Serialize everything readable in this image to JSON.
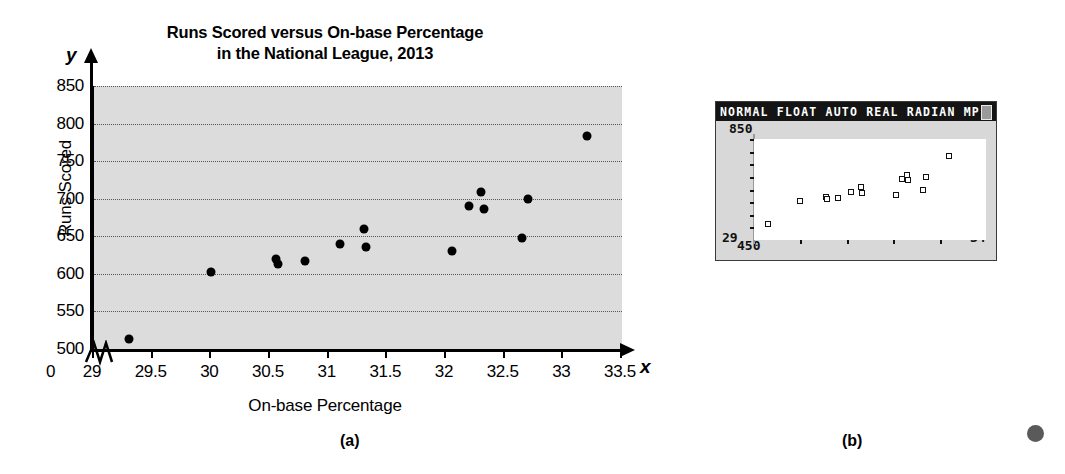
{
  "figure": {
    "panel_a_caption": "(a)",
    "panel_b_caption": "(b)"
  },
  "chart_data": {
    "type": "scatter",
    "title": "Runs Scored versus On-base Percentage in the National League, 2013",
    "title_line1": "Runs Scored versus On-base Percentage",
    "title_line2": "in the National League, 2013",
    "xlabel": "On-base Percentage",
    "ylabel": "Runs Scored",
    "x_axis_variable": "x",
    "y_axis_variable": "y",
    "origin_label": "0",
    "xlim": [
      29,
      33.5
    ],
    "ylim": [
      500,
      850
    ],
    "xticks": [
      "29",
      "29.5",
      "30",
      "30.5",
      "31",
      "31.5",
      "32",
      "32.5",
      "33",
      "33.5"
    ],
    "xtick_values": [
      29,
      29.5,
      30,
      30.5,
      31,
      31.5,
      32,
      32.5,
      33,
      33.5
    ],
    "yticks": [
      "500",
      "550",
      "600",
      "650",
      "700",
      "750",
      "800",
      "850"
    ],
    "ytick_values": [
      500,
      550,
      600,
      650,
      700,
      750,
      800,
      850
    ],
    "grid": true,
    "axis_break": true,
    "legend": "none",
    "marker": "filled-circle",
    "points": [
      {
        "x": 29.3,
        "y": 513
      },
      {
        "x": 30.0,
        "y": 603
      },
      {
        "x": 30.55,
        "y": 620
      },
      {
        "x": 30.57,
        "y": 613
      },
      {
        "x": 30.8,
        "y": 617
      },
      {
        "x": 31.1,
        "y": 640
      },
      {
        "x": 31.3,
        "y": 660
      },
      {
        "x": 31.32,
        "y": 636
      },
      {
        "x": 32.05,
        "y": 630
      },
      {
        "x": 32.2,
        "y": 690
      },
      {
        "x": 32.3,
        "y": 709
      },
      {
        "x": 32.32,
        "y": 686
      },
      {
        "x": 32.65,
        "y": 648
      },
      {
        "x": 32.7,
        "y": 700
      },
      {
        "x": 33.2,
        "y": 783
      }
    ]
  },
  "calculator": {
    "statusbar": "NORMAL FLOAT AUTO REAL RADIAN MP",
    "battery_icon": "battery-icon",
    "window": {
      "xmin_label": "29",
      "xmax_label": "34",
      "ymin_label": "450",
      "ymax_label": "850",
      "xmin": 29,
      "xmax": 34,
      "ymin": 450,
      "ymax": 850
    },
    "plot": {
      "type": "scatter",
      "marker": "open-square",
      "points": [
        {
          "x": 29.3,
          "y": 513
        },
        {
          "x": 30.0,
          "y": 603
        },
        {
          "x": 30.55,
          "y": 620
        },
        {
          "x": 30.57,
          "y": 613
        },
        {
          "x": 30.8,
          "y": 617
        },
        {
          "x": 31.1,
          "y": 640
        },
        {
          "x": 31.3,
          "y": 660
        },
        {
          "x": 31.32,
          "y": 636
        },
        {
          "x": 32.05,
          "y": 630
        },
        {
          "x": 32.2,
          "y": 690
        },
        {
          "x": 32.3,
          "y": 709
        },
        {
          "x": 32.32,
          "y": 686
        },
        {
          "x": 32.65,
          "y": 648
        },
        {
          "x": 32.7,
          "y": 700
        },
        {
          "x": 33.2,
          "y": 783
        }
      ]
    }
  }
}
